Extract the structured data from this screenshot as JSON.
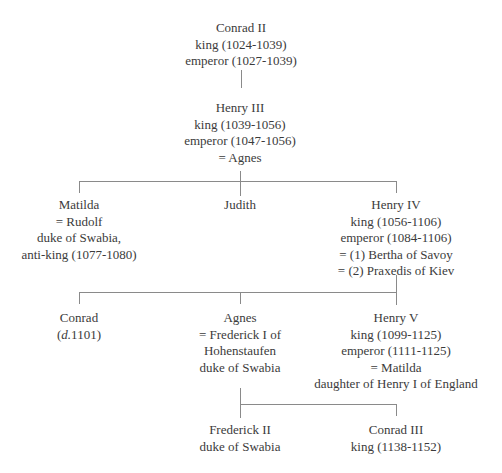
{
  "nodes": {
    "conrad_ii": {
      "name": "Conrad II",
      "lines": [
        "king (1024-1039)",
        "emperor (1027-1039)"
      ]
    },
    "henry_iii": {
      "name": "Henry III",
      "lines": [
        "king (1039-1056)",
        "emperor (1047-1056)",
        "= Agnes"
      ]
    },
    "matilda": {
      "name": "Matilda",
      "lines": [
        "= Rudolf",
        "duke of Swabia,",
        "anti-king (1077-1080)"
      ]
    },
    "judith": {
      "name": "Judith",
      "lines": []
    },
    "henry_iv": {
      "name": "Henry IV",
      "lines": [
        "king (1056-1106)",
        "emperor (1084-1106)",
        "= (1) Bertha of Savoy",
        "= (2) Praxedis of Kiev"
      ]
    },
    "conrad": {
      "name": "Conrad",
      "died_prefix": "d.",
      "died": "1101"
    },
    "agnes": {
      "name": "Agnes",
      "lines": [
        "= Frederick I of",
        "Hohenstaufen",
        "duke of Swabia"
      ]
    },
    "henry_v": {
      "name": "Henry V",
      "lines": [
        "king (1099-1125)",
        "emperor (1111-1125)",
        "= Matilda",
        "daughter of Henry I of England"
      ]
    },
    "frederick_ii": {
      "name": "Frederick II",
      "lines": [
        "duke of Swabia"
      ]
    },
    "conrad_iii": {
      "name": "Conrad III",
      "lines": [
        "king (1138-1152)"
      ]
    }
  }
}
